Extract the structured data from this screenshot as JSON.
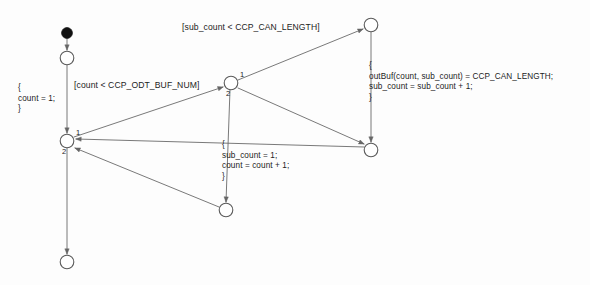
{
  "diagram": {
    "type": "state-machine-activity-diagram",
    "background_color": "#fdfdfd",
    "stroke_color": "#555555",
    "text_color": "#1c1c1c",
    "nodes": [
      {
        "id": "initial",
        "kind": "initial-node",
        "shape": "filled-circle",
        "x": 67,
        "y": 33,
        "r": 5
      },
      {
        "id": "state-start",
        "kind": "state-node",
        "shape": "circle",
        "x": 67,
        "y": 58,
        "r": 7
      },
      {
        "id": "junction-left",
        "kind": "junction-node",
        "shape": "circle",
        "x": 67,
        "y": 141,
        "r": 7
      },
      {
        "id": "junction-center",
        "kind": "junction-node",
        "shape": "circle",
        "x": 231,
        "y": 83,
        "r": 7
      },
      {
        "id": "state-bottom-left",
        "kind": "state-node",
        "shape": "circle",
        "x": 67,
        "y": 262,
        "r": 7
      },
      {
        "id": "state-bottom-center",
        "kind": "state-node",
        "shape": "circle",
        "x": 226,
        "y": 210,
        "r": 7
      },
      {
        "id": "state-top-right",
        "kind": "state-node",
        "shape": "circle",
        "x": 371,
        "y": 25,
        "r": 7
      },
      {
        "id": "state-right-middle",
        "kind": "state-node",
        "shape": "circle",
        "x": 371,
        "y": 150,
        "r": 7
      }
    ],
    "edges": [
      {
        "id": "e-initial-to-start",
        "from": "initial",
        "to": "state-start"
      },
      {
        "id": "e-start-to-junction-left",
        "from": "state-start",
        "to": "junction-left"
      },
      {
        "id": "e-junction-left-to-junction-center",
        "from": "junction-left",
        "to": "junction-center"
      },
      {
        "id": "e-junction-center-to-top-right",
        "from": "junction-center",
        "to": "state-top-right"
      },
      {
        "id": "e-junction-center-to-bottom-center",
        "from": "junction-center",
        "to": "state-bottom-center"
      },
      {
        "id": "e-junction-center-to-right-middle",
        "from": "junction-center",
        "to": "state-right-middle"
      },
      {
        "id": "e-top-right-to-right-middle",
        "from": "state-top-right",
        "to": "state-right-middle"
      },
      {
        "id": "e-right-middle-to-junction-left",
        "from": "state-right-middle",
        "to": "junction-left"
      },
      {
        "id": "e-bottom-center-to-junction-left",
        "from": "state-bottom-center",
        "to": "junction-left"
      },
      {
        "id": "e-junction-left-to-bottom-left",
        "from": "junction-left",
        "to": "state-bottom-left"
      }
    ],
    "port_numbers": {
      "junction_left_port_1": "1",
      "junction_left_port_2": "2",
      "junction_center_port_1": "1",
      "junction_center_port_2": "2"
    },
    "guards": {
      "guard_odt_buf_num": "[count < CCP_ODT_BUF_NUM]",
      "guard_can_length": "[sub_count < CCP_CAN_LENGTH]"
    },
    "actions": {
      "action_init_count": "{\ncount = 1;\n}",
      "action_reset_subcount": "{\nsub_count = 1;\ncount = count + 1;\n}",
      "action_outbuf": "{\noutBuf(count, sub_count) = CCP_CAN_LENGTH;\nsub_count = sub_count + 1;\n}"
    }
  }
}
